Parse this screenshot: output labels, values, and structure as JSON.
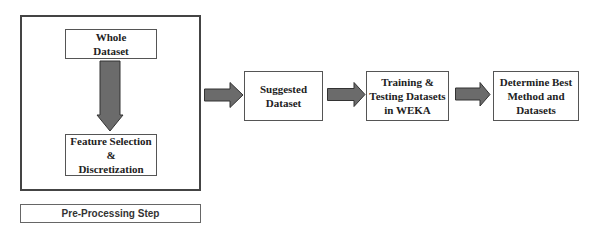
{
  "diagram": {
    "preprocessing_group": {
      "label": "Pre-Processing Step",
      "steps": [
        {
          "lines": [
            "Whole",
            "Dataset"
          ]
        },
        {
          "lines": [
            "Feature Selection",
            "&",
            "Discretization"
          ]
        }
      ]
    },
    "flow_steps": [
      {
        "lines": [
          "Suggested",
          "Dataset"
        ]
      },
      {
        "lines": [
          "Training &",
          "Testing Datasets",
          "in WEKA"
        ]
      },
      {
        "lines": [
          "Determine Best",
          "Method and",
          "Datasets"
        ]
      }
    ],
    "colors": {
      "arrow_fill": "#6b6b6b",
      "arrow_stroke": "#333333",
      "box_border": "#555555",
      "text": "#222222"
    }
  }
}
